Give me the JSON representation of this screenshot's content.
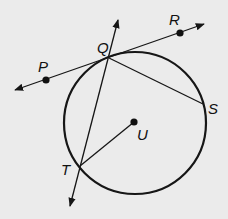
{
  "diagram": {
    "type": "circle-geometry",
    "background": "#ebebeb",
    "ink": "#161616",
    "circle": {
      "name": "U",
      "center": [
        135,
        123
      ],
      "radius": 71
    },
    "points": {
      "P": {
        "label": "P",
        "pos": [
          46,
          80
        ],
        "label_pos": [
          38,
          72
        ]
      },
      "Q": {
        "label": "Q",
        "pos": [
          109,
          58
        ],
        "label_pos": [
          97,
          53
        ]
      },
      "R": {
        "label": "R",
        "pos": [
          180,
          33
        ],
        "label_pos": [
          169,
          25
        ]
      },
      "S": {
        "label": "S",
        "pos": [
          203,
          104
        ],
        "label_pos": [
          208,
          114
        ]
      },
      "T": {
        "label": "T",
        "pos": [
          80,
          166
        ],
        "label_pos": [
          61,
          175
        ]
      },
      "U": {
        "label": "U",
        "pos": [
          134,
          122
        ],
        "label_pos": [
          137,
          140
        ]
      }
    },
    "lines": [
      {
        "name": "tangent-line-PR",
        "from": [
          15,
          90
        ],
        "to": [
          204,
          24
        ],
        "arrows": "both",
        "through": [
          "P",
          "Q",
          "R"
        ]
      },
      {
        "name": "secant-line-QT",
        "from": [
          118,
          20
        ],
        "to": [
          70,
          206
        ],
        "arrows": "both",
        "through": [
          "Q",
          "T"
        ]
      }
    ],
    "segments": [
      {
        "name": "chord-QS",
        "from": "Q",
        "to": "S"
      },
      {
        "name": "radius-UT",
        "from": "U",
        "to": "T"
      }
    ]
  }
}
